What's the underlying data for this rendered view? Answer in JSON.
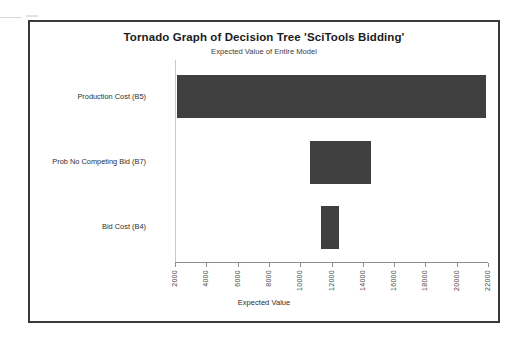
{
  "chart_data": {
    "type": "bar",
    "orientation": "horizontal",
    "variant": "tornado",
    "title": "Tornado Graph of Decision Tree 'SciTools Bidding'",
    "subtitle": "Expected Value of Entire Model",
    "xlabel": "Expected Value",
    "ylabel": "",
    "xlim": [
      2000,
      22000
    ],
    "ylim": null,
    "grid": false,
    "legend": null,
    "bar_color": "#3f3f40",
    "xticks": [
      2000,
      4000,
      6000,
      8000,
      10000,
      12000,
      14000,
      16000,
      18000,
      20000,
      22000
    ],
    "xtick_labels": [
      "2000",
      "4000",
      "6000",
      "8000",
      "10000",
      "12000",
      "14000",
      "16000",
      "18000",
      "20000",
      "22000"
    ],
    "categories": [
      "Production Cost (B5)",
      "Prob No Competing Bid (B7)",
      "Bid Cost (B4)"
    ],
    "bars": [
      {
        "category": "Production Cost (B5)",
        "low": 2150,
        "high": 21900
      },
      {
        "category": "Prob No Competing Bid (B7)",
        "low": 10600,
        "high": 14500
      },
      {
        "category": "Bid Cost (B4)",
        "low": 11300,
        "high": 12500
      }
    ],
    "series": [
      {
        "name": "low",
        "values": [
          2150,
          10600,
          11300
        ]
      },
      {
        "name": "high",
        "values": [
          21900,
          14500,
          12500
        ]
      }
    ]
  }
}
